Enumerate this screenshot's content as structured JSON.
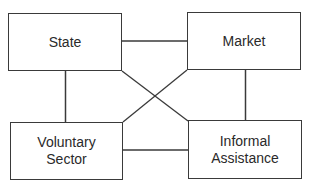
{
  "diagram": {
    "type": "relationship-diagram",
    "nodes": [
      {
        "id": "state",
        "label": "State"
      },
      {
        "id": "market",
        "label": "Market"
      },
      {
        "id": "voluntary",
        "label": "Voluntary\nSector"
      },
      {
        "id": "informal",
        "label": "Informal\nAssistance"
      }
    ],
    "edges": [
      {
        "from": "state",
        "to": "market"
      },
      {
        "from": "state",
        "to": "voluntary"
      },
      {
        "from": "market",
        "to": "informal"
      },
      {
        "from": "voluntary",
        "to": "informal"
      },
      {
        "from": "state",
        "to": "informal"
      },
      {
        "from": "market",
        "to": "voluntary"
      }
    ],
    "colors": {
      "line": "#3a3a3a",
      "text": "#2a2a2a",
      "background": "#ffffff"
    }
  }
}
